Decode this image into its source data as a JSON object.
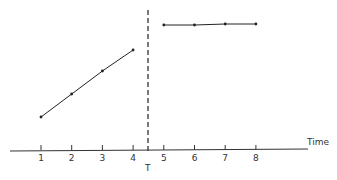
{
  "chart_data": {
    "type": "line",
    "title": "",
    "xlabel": "Time",
    "ylabel": "",
    "x": [
      1,
      2,
      3,
      4,
      5,
      6,
      7,
      8
    ],
    "series": [
      {
        "name": "before T",
        "x": [
          1,
          2,
          3,
          4
        ],
        "values": [
          33,
          56,
          79,
          100
        ]
      },
      {
        "name": "after T",
        "x": [
          5,
          6,
          7,
          8
        ],
        "values": [
          125,
          125,
          126,
          126
        ]
      }
    ],
    "tick_labels": [
      "1",
      "2",
      "3",
      "4",
      "5",
      "6",
      "7",
      "8"
    ],
    "annotations": [
      {
        "type": "vertical-dashed-line",
        "x": 4.5,
        "label": "T"
      }
    ],
    "xlim": [
      -0.2,
      9.8
    ],
    "ylim": [
      0,
      135
    ],
    "grid": false,
    "legend": "none"
  },
  "labels": {
    "axis_title": "Time",
    "threshold": "T"
  },
  "colors": {
    "line": "#222222",
    "axis": "#333333"
  }
}
